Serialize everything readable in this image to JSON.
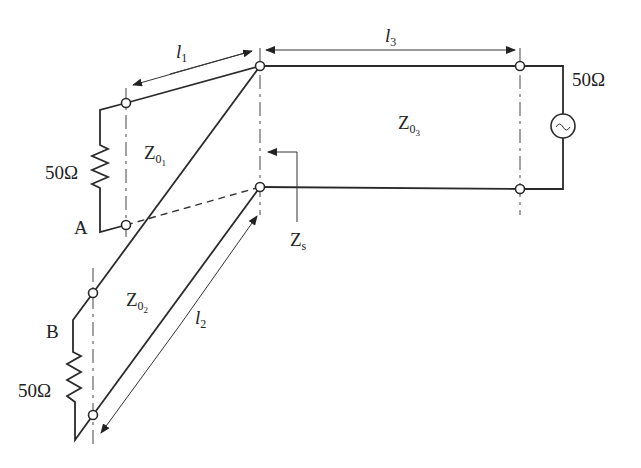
{
  "diagram": {
    "type": "transmission-line-circuit",
    "labels": {
      "l1": {
        "base": "l",
        "sub": "1"
      },
      "l2": {
        "base": "l",
        "sub": "2"
      },
      "l3": {
        "base": "l",
        "sub": "3"
      },
      "z01": {
        "base": "Z",
        "sub": "0",
        "subsub": "1"
      },
      "z02": {
        "base": "Z",
        "sub": "0",
        "subsub": "2"
      },
      "z03": {
        "base": "Z",
        "sub": "0",
        "subsub": "3"
      },
      "zs": {
        "base": "Z",
        "sub": "s"
      },
      "node_a": "A",
      "node_b": "B",
      "load_a": "50Ω",
      "load_b": "50Ω",
      "source": "50Ω"
    },
    "components": [
      {
        "id": "line1",
        "impedance": "Z01",
        "length": "l1",
        "termination": "50Ω at A"
      },
      {
        "id": "line2",
        "impedance": "Z02",
        "length": "l2",
        "termination": "50Ω at B"
      },
      {
        "id": "line3",
        "impedance": "Z03",
        "length": "l3",
        "termination": "50Ω source"
      }
    ],
    "colors": {
      "ink": "#2a2a2a",
      "background": "#ffffff"
    }
  }
}
